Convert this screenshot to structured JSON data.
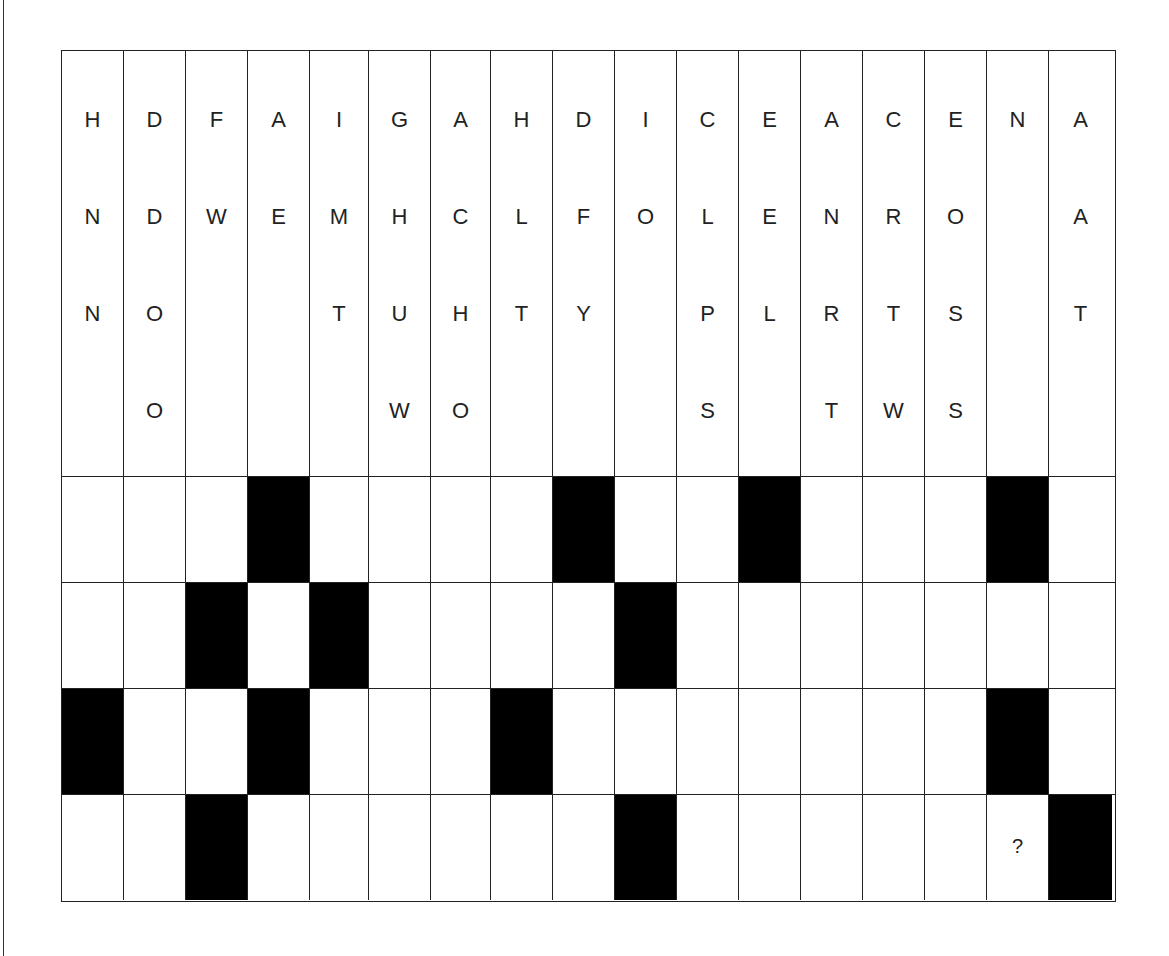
{
  "puzzle": {
    "columns": [
      {
        "letters": [
          "H",
          "N",
          "N",
          ""
        ]
      },
      {
        "letters": [
          "D",
          "D",
          "O",
          "O"
        ]
      },
      {
        "letters": [
          "F",
          "W",
          "",
          ""
        ]
      },
      {
        "letters": [
          "A",
          "E",
          "",
          ""
        ]
      },
      {
        "letters": [
          "I",
          "M",
          "T",
          ""
        ]
      },
      {
        "letters": [
          "G",
          "H",
          "U",
          "W"
        ]
      },
      {
        "letters": [
          "A",
          "C",
          "H",
          "O"
        ]
      },
      {
        "letters": [
          "H",
          "L",
          "T",
          ""
        ]
      },
      {
        "letters": [
          "D",
          "F",
          "Y",
          ""
        ]
      },
      {
        "letters": [
          "I",
          "O",
          "",
          ""
        ]
      },
      {
        "letters": [
          "C",
          "L",
          "P",
          "S"
        ]
      },
      {
        "letters": [
          "E",
          "E",
          "L",
          ""
        ]
      },
      {
        "letters": [
          "A",
          "N",
          "R",
          "T"
        ]
      },
      {
        "letters": [
          "C",
          "R",
          "T",
          "W"
        ]
      },
      {
        "letters": [
          "E",
          "O",
          "S",
          "S"
        ]
      },
      {
        "letters": [
          "N",
          "",
          "",
          ""
        ]
      },
      {
        "letters": [
          "A",
          "A",
          "T",
          ""
        ]
      }
    ],
    "grid": [
      [
        0,
        0,
        0,
        1,
        0,
        0,
        0,
        0,
        1,
        0,
        0,
        1,
        0,
        0,
        0,
        1,
        0
      ],
      [
        0,
        0,
        1,
        0,
        1,
        0,
        0,
        0,
        0,
        1,
        0,
        0,
        0,
        0,
        0,
        0,
        0
      ],
      [
        1,
        0,
        0,
        1,
        0,
        0,
        0,
        1,
        0,
        0,
        0,
        0,
        0,
        0,
        0,
        1,
        0
      ],
      [
        0,
        0,
        1,
        0,
        0,
        0,
        0,
        0,
        0,
        1,
        0,
        0,
        0,
        0,
        0,
        "?",
        1
      ]
    ],
    "unknown_mark": "?"
  }
}
